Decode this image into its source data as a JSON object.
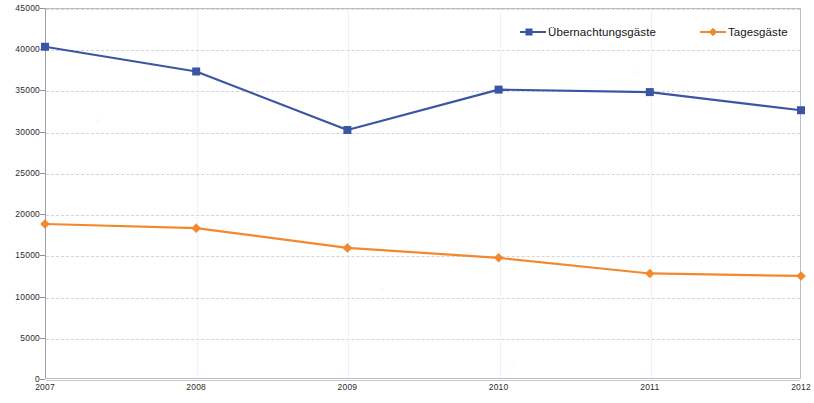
{
  "chart_data": {
    "type": "line",
    "title": "",
    "subtitle": "",
    "xlabel": "",
    "ylabel": "",
    "categories": [
      "2007",
      "2008",
      "2009",
      "2010",
      "2011",
      "2012"
    ],
    "x": [
      2007,
      2008,
      2009,
      2010,
      2011,
      2012
    ],
    "ylim": [
      0,
      45000
    ],
    "ytick_labels": [
      "45000",
      "40000",
      "35000",
      "30000",
      "25000",
      "20000",
      "15000",
      "10000",
      "5000",
      "0"
    ],
    "yticks": [
      45000,
      40000,
      35000,
      30000,
      25000,
      20000,
      15000,
      10000,
      5000,
      0
    ],
    "grid": true,
    "legend_position": "top-right",
    "series": [
      {
        "name": "Übernachtungsgäste",
        "color": "#3b55a4",
        "marker": "square",
        "values": [
          40300,
          37300,
          30200,
          35100,
          34800,
          32600
        ]
      },
      {
        "name": "Tagesgäste",
        "color": "#f2892f",
        "marker": "diamond",
        "values": [
          18800,
          18300,
          15900,
          14700,
          12800,
          12500
        ]
      }
    ]
  },
  "legend": {
    "items": [
      {
        "label": "Übernachtungsgäste",
        "color": "#3b55a4",
        "marker": "square"
      },
      {
        "label": "Tagesgäste",
        "color": "#f2892f",
        "marker": "diamond"
      }
    ]
  },
  "colors": {
    "series_blue": "#3b55a4",
    "series_orange": "#f2892f",
    "grid": "#c8cdd6",
    "axis": "#8b929c",
    "text": "#2b2b2b",
    "background": "#ffffff"
  }
}
